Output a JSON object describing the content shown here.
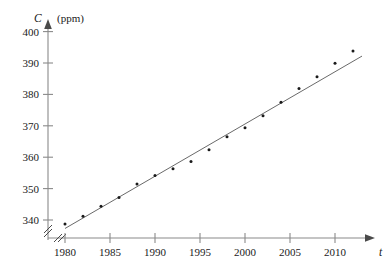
{
  "chart_data": {
    "type": "scatter",
    "title": "",
    "subtitle": "",
    "xlabel": "t",
    "ylabel": "C",
    "ylabel_unit": "(ppm)",
    "xlabel_full": "t",
    "ylabel_full": "C (ppm)",
    "grid": false,
    "legend": "none",
    "axis_break_x": true,
    "axis_break_y": true,
    "xlim": [
      1978.5,
      2013.5
    ],
    "ylim": [
      336,
      402
    ],
    "xticks": [
      1980,
      1985,
      1990,
      1995,
      2000,
      2005,
      2010
    ],
    "xtick_labels": [
      "1980",
      "1985",
      "1990",
      "1995",
      "2000",
      "2005",
      "2010"
    ],
    "yticks": [
      340,
      350,
      360,
      370,
      380,
      390,
      400
    ],
    "ytick_labels": [
      "340",
      "350",
      "360",
      "370",
      "380",
      "390",
      "400"
    ],
    "x": [
      1980,
      1982,
      1984,
      1986,
      1988,
      1990,
      1992,
      1994,
      1996,
      1998,
      2000,
      2002,
      2004,
      2006,
      2008,
      2010,
      2012
    ],
    "values": [
      338.7,
      341.2,
      344.4,
      347.2,
      351.5,
      354.2,
      356.3,
      358.6,
      362.4,
      366.5,
      369.4,
      373.2,
      377.5,
      381.9,
      385.6,
      389.9,
      393.8
    ],
    "series": [
      {
        "name": "CO2 concentration",
        "x": [
          1980,
          1982,
          1984,
          1986,
          1988,
          1990,
          1992,
          1994,
          1996,
          1998,
          2000,
          2002,
          2004,
          2006,
          2008,
          2010,
          2012
        ],
        "values": [
          338.7,
          341.2,
          344.4,
          347.2,
          351.5,
          354.2,
          356.3,
          358.6,
          362.4,
          366.5,
          369.4,
          373.2,
          377.5,
          381.9,
          385.6,
          389.9,
          393.8
        ]
      }
    ],
    "trendline": {
      "type": "line",
      "x": [
        1980,
        2013
      ],
      "y": [
        337.3,
        392.2
      ]
    },
    "colors": {
      "point": "#1a1a1a",
      "axis": "#8a8a8a",
      "trend": "#585858",
      "background": "#ffffff"
    }
  }
}
